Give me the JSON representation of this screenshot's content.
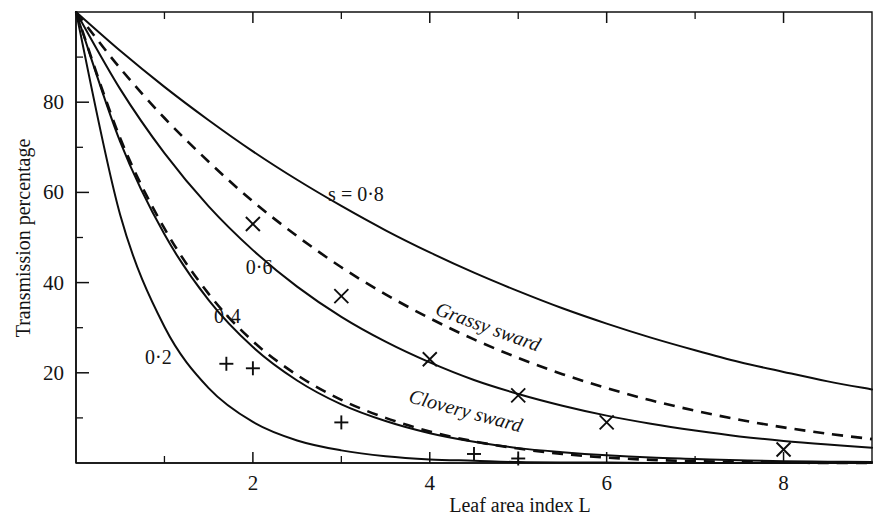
{
  "chart_data": {
    "type": "line",
    "title": "",
    "xlabel": "Leaf area index L",
    "ylabel": "Transmission percentage",
    "xlim": [
      0,
      9
    ],
    "ylim": [
      0,
      100
    ],
    "grid": false,
    "legend_position": "inline-labels",
    "x_ticks_major": [
      2,
      4,
      6,
      8
    ],
    "x_ticks_major_labels": [
      "2",
      "4",
      "6",
      "8"
    ],
    "x_ticks_minor": [
      1,
      3,
      5,
      7,
      9
    ],
    "y_ticks_major": [
      20,
      40,
      60,
      80
    ],
    "y_ticks_major_labels": [
      "20",
      "40",
      "60",
      "80"
    ],
    "y_ticks_minor": [
      10,
      30,
      50,
      70,
      90
    ],
    "series": [
      {
        "name": "s = 0.8",
        "label": "s = 0·8",
        "style": "solid",
        "s": 0.8,
        "x": [
          0,
          0.5,
          1,
          1.5,
          2,
          2.5,
          3,
          3.5,
          4,
          4.5,
          5,
          5.5,
          6,
          6.5,
          7,
          7.5,
          8,
          8.5,
          9
        ],
        "y": [
          100,
          91.4,
          83.4,
          76.0,
          69.1,
          62.8,
          57.0,
          51.6,
          46.7,
          42.2,
          38.1,
          34.3,
          30.9,
          27.8,
          25.0,
          22.4,
          20.2,
          18.1,
          16.3
        ]
      },
      {
        "name": "s = 0.6",
        "label": "0·6",
        "style": "solid",
        "s": 0.6,
        "x": [
          0,
          0.5,
          1,
          1.5,
          2,
          2.5,
          3,
          3.5,
          4,
          4.5,
          5,
          5.5,
          6,
          6.5,
          7,
          7.5,
          8,
          8.5,
          9
        ],
        "y": [
          100,
          82.9,
          68.7,
          56.9,
          47.2,
          39.1,
          32.4,
          26.9,
          22.3,
          18.4,
          15.3,
          12.7,
          10.5,
          8.7,
          7.2,
          5.9,
          4.9,
          4.1,
          3.4
        ]
      },
      {
        "name": "s = 0.4",
        "label": "0·4",
        "style": "solid",
        "s": 0.4,
        "x": [
          0,
          0.5,
          1,
          1.5,
          2,
          2.5,
          3,
          3.5,
          4,
          4.5,
          5,
          5.5,
          6,
          6.5,
          7,
          7.5,
          8,
          8.5,
          9
        ],
        "y": [
          100,
          71.2,
          50.7,
          36.1,
          25.7,
          18.3,
          13.0,
          9.3,
          6.6,
          4.7,
          3.3,
          2.4,
          1.7,
          1.2,
          0.9,
          0.6,
          0.4,
          0.3,
          0.2
        ]
      },
      {
        "name": "s = 0.2",
        "label": "0·2",
        "style": "solid",
        "s": 0.2,
        "x": [
          0,
          0.5,
          1,
          1.5,
          2,
          2.5,
          3,
          3.5,
          4,
          4.5,
          5,
          5.5,
          6,
          6.5,
          7,
          7.5,
          8,
          8.5,
          9
        ],
        "y": [
          100,
          55.0,
          30.2,
          16.6,
          9.1,
          5.0,
          2.8,
          1.5,
          0.8,
          0.5,
          0.2,
          0.1,
          0.1,
          0.0,
          0.0,
          0.0,
          0.0,
          0.0,
          0.0
        ]
      },
      {
        "name": "Grassy sward",
        "label": "Grassy sward",
        "style": "dashed",
        "x": [
          0,
          0.5,
          1,
          1.5,
          2,
          2.5,
          3,
          3.5,
          4,
          4.5,
          5,
          5.5,
          6,
          6.5,
          7,
          7.5,
          8,
          8.5,
          9
        ],
        "y": [
          100,
          87.5,
          76.5,
          66.8,
          58.0,
          50.3,
          43.4,
          37.4,
          32.1,
          27.4,
          23.3,
          19.7,
          16.6,
          13.9,
          11.6,
          9.6,
          7.9,
          6.5,
          5.3
        ]
      },
      {
        "name": "Clovery sward",
        "label": "Clovery sward",
        "style": "dashed",
        "x": [
          0,
          0.5,
          1,
          1.5,
          2,
          2.5,
          3,
          3.5,
          4,
          4.5,
          5,
          5.5,
          6,
          6.5,
          7,
          7.5,
          8,
          8.5,
          9
        ],
        "y": [
          100,
          72.0,
          52.0,
          37.5,
          27.0,
          19.5,
          14.0,
          10.0,
          7.0,
          4.8,
          3.2,
          2.0,
          1.2,
          0.7,
          0.4,
          0.2,
          0.1,
          0.0,
          0.0
        ]
      }
    ],
    "scatter": [
      {
        "name": "grassy-sward-observations",
        "marker": "cross",
        "points": [
          {
            "x": 2,
            "y": 53
          },
          {
            "x": 3,
            "y": 37
          },
          {
            "x": 4,
            "y": 23
          },
          {
            "x": 5,
            "y": 15
          },
          {
            "x": 6,
            "y": 9
          },
          {
            "x": 8,
            "y": 3
          }
        ]
      },
      {
        "name": "clovery-sward-observations",
        "marker": "plus",
        "points": [
          {
            "x": 1.7,
            "y": 22
          },
          {
            "x": 2.0,
            "y": 21
          },
          {
            "x": 3.0,
            "y": 9
          },
          {
            "x": 4.5,
            "y": 2
          },
          {
            "x": 5.0,
            "y": 1
          }
        ]
      }
    ],
    "annotations": [
      {
        "text": "s = 0·8",
        "x": 2.85,
        "y": 58,
        "rotate": 0
      },
      {
        "text": "0·6",
        "x": 1.92,
        "y": 42,
        "rotate": 0
      },
      {
        "text": "0·4",
        "x": 1.56,
        "y": 31,
        "rotate": 0
      },
      {
        "text": "0·2",
        "x": 0.78,
        "y": 22,
        "rotate": 0
      },
      {
        "text": "Grassy sward",
        "x": 4.05,
        "y": 33,
        "rotate": 20
      },
      {
        "text": "Clovery sward",
        "x": 3.75,
        "y": 13.5,
        "rotate": 15
      }
    ]
  },
  "axes": {
    "y_title": "Transmission percentage",
    "x_title": "Leaf area index L"
  }
}
